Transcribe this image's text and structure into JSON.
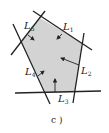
{
  "figure": {
    "caption": "c )",
    "fill_color": "#d3d3d3",
    "line_color": "#222222",
    "polygon": [
      [
        40,
        18
      ],
      [
        82,
        43
      ],
      [
        75,
        92
      ],
      [
        46,
        93
      ],
      [
        22,
        42
      ]
    ],
    "lines": [
      {
        "name": "L1",
        "base": "L",
        "sub": "1",
        "x1": 33,
        "y1": 11,
        "x2": 92,
        "y2": 50,
        "label_x": 63,
        "label_y": 30
      },
      {
        "name": "L2",
        "base": "L",
        "sub": "2",
        "x1": 84,
        "y1": 33,
        "x2": 73,
        "y2": 103,
        "label_x": 81,
        "label_y": 74
      },
      {
        "name": "L3",
        "base": "L",
        "sub": "3",
        "x1": 15,
        "y1": 93,
        "x2": 101,
        "y2": 91,
        "label_x": 58,
        "label_y": 102
      },
      {
        "name": "L4",
        "base": "L",
        "sub": "4",
        "x1": 13,
        "y1": 24,
        "x2": 50,
        "y2": 104,
        "label_x": 25,
        "label_y": 75
      },
      {
        "name": "L5",
        "base": "L",
        "sub": "5",
        "x1": 11,
        "y1": 55,
        "x2": 45,
        "y2": 11,
        "label_x": 24,
        "label_y": 29
      }
    ],
    "arrows": [
      {
        "for": "L1",
        "x1": 62,
        "y1": 34,
        "x2": 57,
        "y2": 39
      },
      {
        "for": "L2",
        "x1": 79,
        "y1": 65,
        "x2": 61,
        "y2": 58
      },
      {
        "for": "L3",
        "x1": 55,
        "y1": 92,
        "x2": 55,
        "y2": 79
      },
      {
        "for": "L4",
        "x1": 38,
        "y1": 76,
        "x2": 44,
        "y2": 71
      },
      {
        "for": "L5",
        "x1": 28,
        "y1": 35,
        "x2": 34,
        "y2": 40
      }
    ]
  }
}
